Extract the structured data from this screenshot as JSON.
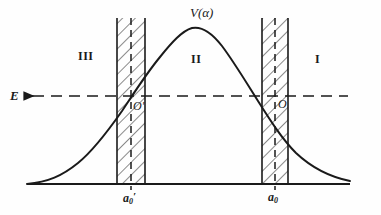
{
  "figure": {
    "background_color": "#fefefe",
    "stroke_color": "#1a1a1a"
  },
  "labels": {
    "potential_curve": "V(α)",
    "region_left": "III",
    "region_middle": "II",
    "region_right": "I",
    "energy_level": "E",
    "origin_left": "O′",
    "origin_right": "O",
    "axis_tick_left_base": "a",
    "axis_tick_left_sub": "0",
    "axis_tick_left_prime": "′",
    "axis_tick_right_base": "a",
    "axis_tick_right_sub": "0"
  },
  "chart_data": {
    "type": "line",
    "title": "V(α)",
    "xlabel": "",
    "ylabel": "",
    "grid": false,
    "legend": false,
    "series": [
      {
        "name": "V(α)",
        "style": "solid",
        "points": [
          [
            27,
            184
          ],
          [
            40,
            181
          ],
          [
            55,
            176
          ],
          [
            70,
            168
          ],
          [
            85,
            156
          ],
          [
            100,
            140
          ],
          [
            115,
            121
          ],
          [
            128,
            104
          ],
          [
            140,
            86
          ],
          [
            152,
            68
          ],
          [
            165,
            50
          ],
          [
            178,
            36
          ],
          [
            192,
            28
          ],
          [
            205,
            28
          ],
          [
            218,
            34
          ],
          [
            231,
            46
          ],
          [
            244,
            62
          ],
          [
            257,
            80
          ],
          [
            270,
            99
          ],
          [
            283,
            118
          ],
          [
            296,
            135
          ],
          [
            309,
            150
          ],
          [
            322,
            162
          ],
          [
            335,
            172
          ],
          [
            350,
            180
          ]
        ]
      },
      {
        "name": "E",
        "style": "dashed",
        "orientation": "horizontal",
        "y": 96,
        "x_start": 22,
        "x_end": 348
      }
    ],
    "baseline": {
      "y": 184,
      "x_start": 27,
      "x_end": 350
    },
    "barriers": [
      {
        "name": "left-barrier",
        "label": "a₀′",
        "x_left": 117,
        "x_right": 145,
        "center_dashed_x": 131,
        "y_top": 18,
        "y_bottom": 184,
        "hatched": true
      },
      {
        "name": "right-barrier",
        "label": "a₀",
        "x_left": 262,
        "x_right": 288,
        "center_dashed_x": 275,
        "y_top": 18,
        "y_bottom": 184,
        "hatched": true
      }
    ],
    "regions": [
      {
        "label": "III",
        "x": 85,
        "y": 57
      },
      {
        "label": "II",
        "x": 196,
        "y": 60
      },
      {
        "label": "I",
        "x": 317,
        "y": 60
      }
    ],
    "annotations": [
      {
        "text": "V(α)",
        "x": 200,
        "y": 13
      },
      {
        "text": "E",
        "x": 16,
        "y": 96
      },
      {
        "text": "O′",
        "x": 137,
        "y": 107
      },
      {
        "text": "O",
        "x": 282,
        "y": 105
      },
      {
        "text": "a₀′",
        "x": 131,
        "y": 198
      },
      {
        "text": "a₀",
        "x": 275,
        "y": 198
      }
    ]
  }
}
